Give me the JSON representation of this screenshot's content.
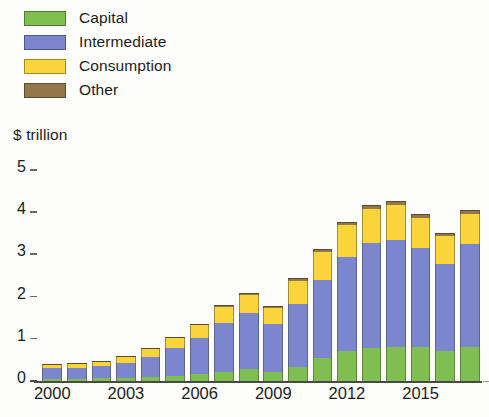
{
  "chart_data": {
    "type": "bar",
    "subtype": "stacked-bar",
    "title": "",
    "subtitle": "",
    "xlabel": "",
    "ylabel": "$ trillion",
    "ylim": [
      0,
      5
    ],
    "yticks": [
      0,
      1,
      2,
      3,
      4,
      5
    ],
    "ytick_labels": [
      "0",
      "1",
      "2",
      "3",
      "4",
      "5"
    ],
    "grid": false,
    "legend_position": "top-left",
    "categories": [
      "2000",
      "2001",
      "2002",
      "2003",
      "2004",
      "2005",
      "2006",
      "2007",
      "2008",
      "2009",
      "2010",
      "2011",
      "2012",
      "2013",
      "2014",
      "2015",
      "2016",
      "2017"
    ],
    "xtick_labels": [
      "2000",
      "2003",
      "2006",
      "2009",
      "2012",
      "2015"
    ],
    "series": [
      {
        "name": "Capital",
        "color": "#7fbf52",
        "values": [
          0.05,
          0.05,
          0.06,
          0.07,
          0.09,
          0.12,
          0.17,
          0.22,
          0.28,
          0.22,
          0.33,
          0.55,
          0.7,
          0.78,
          0.8,
          0.8,
          0.72,
          0.8
        ]
      },
      {
        "name": "Intermediate",
        "color": "#7b86cf",
        "values": [
          0.25,
          0.26,
          0.29,
          0.36,
          0.49,
          0.66,
          0.85,
          1.15,
          1.33,
          1.12,
          1.5,
          1.85,
          2.25,
          2.5,
          2.55,
          2.35,
          2.05,
          2.45
        ]
      },
      {
        "name": "Consumption",
        "color": "#f9d53b",
        "values": [
          0.08,
          0.09,
          0.1,
          0.13,
          0.17,
          0.23,
          0.3,
          0.38,
          0.43,
          0.4,
          0.55,
          0.65,
          0.75,
          0.8,
          0.82,
          0.72,
          0.66,
          0.72
        ]
      },
      {
        "name": "Other",
        "color": "#93764a",
        "values": [
          0.01,
          0.01,
          0.01,
          0.02,
          0.02,
          0.03,
          0.03,
          0.04,
          0.05,
          0.04,
          0.06,
          0.07,
          0.08,
          0.09,
          0.09,
          0.08,
          0.07,
          0.08
        ]
      }
    ],
    "totals": [
      0.39,
      0.41,
      0.46,
      0.58,
      0.77,
      1.04,
      1.35,
      1.79,
      2.09,
      1.78,
      2.44,
      3.12,
      3.78,
      4.17,
      4.26,
      3.95,
      3.5,
      4.05
    ]
  },
  "legend": {
    "items": [
      {
        "label": "Capital",
        "color": "#7fbf52"
      },
      {
        "label": "Intermediate",
        "color": "#7b86cf"
      },
      {
        "label": "Consumption",
        "color": "#f9d53b"
      },
      {
        "label": "Other",
        "color": "#93764a"
      }
    ]
  },
  "axis": {
    "y_title": "$ trillion"
  }
}
